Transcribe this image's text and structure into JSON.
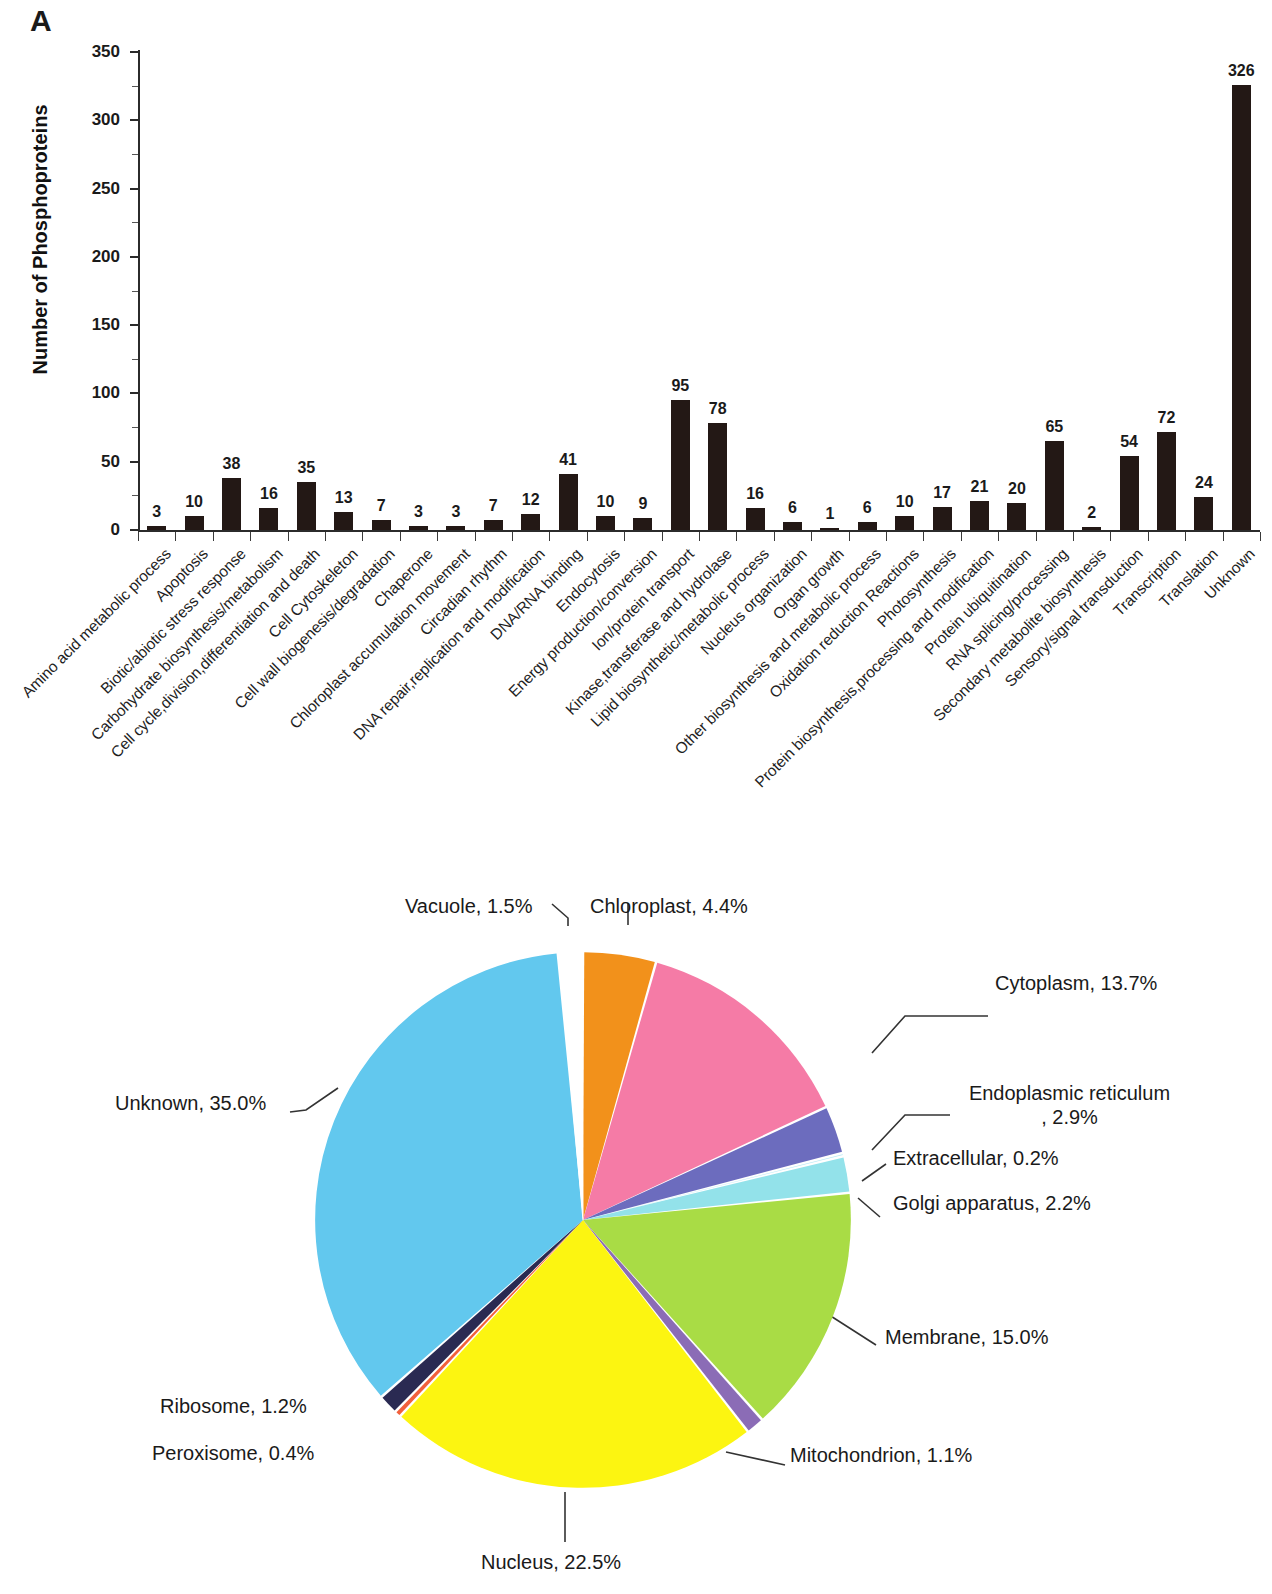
{
  "panels": {
    "a_letter": "A",
    "b_letter": "B"
  },
  "chart_data": [
    {
      "type": "bar",
      "title": "",
      "xlabel": "",
      "ylabel": "Number of Phosphoproteins",
      "ylim": [
        0,
        350
      ],
      "yticks": [
        0,
        50,
        100,
        150,
        200,
        250,
        300,
        350
      ],
      "grid": false,
      "bar_color": "#231815",
      "categories": [
        "Amino acid metabolic process",
        "Apoptosis",
        "Biotic/abiotic stress  response",
        "Carbohydrate biosynthesis/metabolism",
        "Cell cycle,division,differentiation and  death",
        "Cell Cytoskeleton",
        "Cell wall biogenesis/degradation",
        "Chaperone",
        "Chloroplast accumulation movement",
        "Circadian rhythm",
        "DNA repair,replication and modification",
        "DNA/RNA binding",
        "Endocytosis",
        "Energy production/conversion",
        "Ion/protein transport",
        "Kinase,transferase and hydrolase",
        "Lipid biosynthetic/metabolic process",
        "Nucleus organization",
        "Organ growth",
        "Other biosynthesis and metabolic process",
        "Oxidation reduction Reactions",
        "Photosynthesis",
        "Protein biosynthesis,processing  and modification",
        "Protein ubiquitination",
        "RNA splicing/processing",
        "Secondary metabolite biosynthesis",
        "Sensory/signal transduction",
        "Transcription",
        "Translation",
        "Unknown"
      ],
      "values": [
        3,
        10,
        38,
        16,
        35,
        13,
        7,
        3,
        3,
        7,
        12,
        41,
        10,
        9,
        95,
        78,
        16,
        6,
        1,
        6,
        10,
        17,
        21,
        20,
        65,
        2,
        54,
        72,
        24,
        326
      ]
    },
    {
      "type": "pie",
      "title": "",
      "legend_position": "callout-labels",
      "labels": [
        "Chloroplast",
        "Cytoplasm",
        "Endoplasmic reticulum",
        "Extracellular",
        "Golgi apparatus",
        "Membrane",
        "Mitochondrion",
        "Nucleus",
        "Peroxisome",
        "Ribosome",
        "Unknown",
        "Vacuole"
      ],
      "values": [
        4.4,
        13.7,
        2.9,
        0.2,
        2.2,
        15.0,
        1.1,
        22.5,
        0.4,
        1.2,
        35.0,
        1.5
      ],
      "display_labels": [
        "Chloroplast, 4.4%",
        "Cytoplasm, 13.7%",
        "Endoplasmic reticulum , 2.9%",
        "Extracellular, 0.2%",
        "Golgi apparatus, 2.2%",
        "Membrane, 15.0%",
        "Mitochondrion, 1.1%",
        "Nucleus, 22.5%",
        "Peroxisome, 0.4%",
        "Ribosome, 1.2%",
        "Unknown, 35.0%",
        "Vacuole, 1.5%"
      ],
      "colors": [
        "#F2911B",
        "#F57BA6",
        "#6C6CBE",
        "#B9EAF5",
        "#93E2EA",
        "#A9DC45",
        "#8B6CB6",
        "#FCF511",
        "#F2603C",
        "#2A2A52",
        "#62C8EE",
        "#FFFFFF"
      ],
      "label_er_line1": "Endoplasmic reticulum",
      "label_er_line2": ", 2.9%"
    }
  ]
}
